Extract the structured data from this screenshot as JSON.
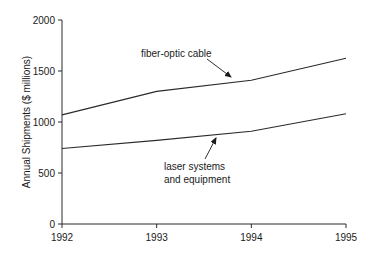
{
  "chart_data": {
    "type": "line",
    "title": "",
    "xlabel": "",
    "ylabel": "Annual Shipments ($ millions)",
    "x": [
      1992,
      1993,
      1994,
      1995
    ],
    "xlim": [
      1992,
      1995
    ],
    "ylim": [
      0,
      2000
    ],
    "yticks": [
      0,
      500,
      1000,
      1500,
      2000
    ],
    "xticks": [
      1992,
      1993,
      1994,
      1995
    ],
    "grid": false,
    "legend": "none (inline annotations with arrows)",
    "series": [
      {
        "name": "fiber-optic cable",
        "values": [
          1070,
          1300,
          1410,
          1625
        ]
      },
      {
        "name": "laser systems and equipment",
        "values": [
          740,
          820,
          910,
          1080
        ]
      }
    ],
    "annotations": [
      {
        "text": "fiber-optic cable",
        "points_to": "fiber-optic cable",
        "near_x": 1993.8
      },
      {
        "text_lines": [
          "laser systems",
          "and equipment"
        ],
        "points_to": "laser systems and equipment",
        "near_x": 1993.6
      }
    ]
  },
  "labels": {
    "ylabel": "Annual Shipments ($ millions)",
    "yticks": [
      "0",
      "500",
      "1000",
      "1500",
      "2000"
    ],
    "xticks": [
      "1992",
      "1993",
      "1994",
      "1995"
    ],
    "annot_fiber": "fiber-optic cable",
    "annot_laser_1": "laser systems",
    "annot_laser_2": "and equipment"
  }
}
